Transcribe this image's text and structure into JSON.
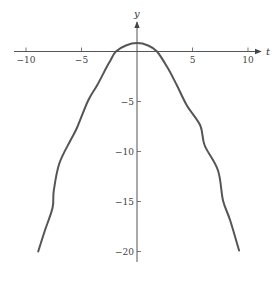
{
  "chart_data": {
    "type": "line",
    "title": "",
    "xlabel": "t",
    "ylabel": "y",
    "xlim": [
      -11,
      11
    ],
    "ylim": [
      -22,
      4
    ],
    "grid": false,
    "legend": null,
    "x_ticks": [
      -10,
      -5,
      5,
      10
    ],
    "x_tick_labels": [
      "−10",
      "−5",
      "5",
      "10"
    ],
    "y_ticks": [
      -5,
      -10,
      -15,
      -20
    ],
    "y_tick_labels": [
      "−5",
      "−10",
      "−15",
      "−20"
    ],
    "series": [
      {
        "name": "y(t)",
        "color": "#555555",
        "points": [
          [
            -8.9,
            -20.0
          ],
          [
            -8.3,
            -17.9
          ],
          [
            -7.6,
            -15.6
          ],
          [
            -7.5,
            -13.9
          ],
          [
            -7.0,
            -11.2
          ],
          [
            -6.0,
            -8.9
          ],
          [
            -5.4,
            -7.6
          ],
          [
            -4.4,
            -4.9
          ],
          [
            -3.6,
            -3.4
          ],
          [
            -2.8,
            -1.7
          ],
          [
            -2.4,
            -0.9
          ],
          [
            -1.9,
            0.0
          ],
          [
            -1.0,
            0.6
          ],
          [
            0.0,
            0.84
          ],
          [
            1.0,
            0.6
          ],
          [
            1.8,
            0.0
          ],
          [
            2.8,
            -1.7
          ],
          [
            3.6,
            -3.4
          ],
          [
            4.5,
            -5.4
          ],
          [
            5.7,
            -7.4
          ],
          [
            6.1,
            -9.4
          ],
          [
            7.3,
            -11.9
          ],
          [
            7.75,
            -14.9
          ],
          [
            8.4,
            -16.9
          ],
          [
            9.2,
            -19.9
          ]
        ]
      }
    ]
  }
}
